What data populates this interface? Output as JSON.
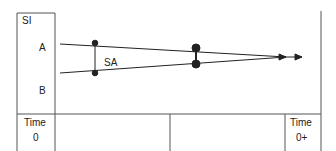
{
  "axis": {
    "y_title": "SI",
    "level_a": "A",
    "level_b": "B"
  },
  "annotation": {
    "span_label": "SA"
  },
  "time_row": {
    "start_label_line1": "Time",
    "start_label_line2": "0",
    "end_label_line1": "Time",
    "end_label_line2": "0+"
  },
  "colors": {
    "line": "#222222",
    "border": "#555555",
    "background": "#ffffff"
  }
}
